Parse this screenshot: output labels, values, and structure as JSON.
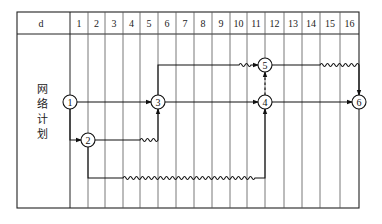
{
  "table": {
    "corner_label": "d",
    "columns": [
      "1",
      "2",
      "3",
      "4",
      "5",
      "6",
      "7",
      "8",
      "9",
      "10",
      "11",
      "12",
      "13",
      "14",
      "15",
      "16"
    ],
    "side_label_chars": [
      "网",
      "络",
      "计",
      "划"
    ]
  },
  "network": {
    "nodes": [
      {
        "id": "1",
        "label": "1"
      },
      {
        "id": "2",
        "label": "2"
      },
      {
        "id": "3",
        "label": "3"
      },
      {
        "id": "4",
        "label": "4"
      },
      {
        "id": "5",
        "label": "5"
      },
      {
        "id": "6",
        "label": "6"
      }
    ],
    "arrows": [
      {
        "from": "1",
        "to": "3",
        "type": "solid"
      },
      {
        "from": "1",
        "to": "2",
        "type": "solid"
      },
      {
        "from": "2",
        "to": "3",
        "type": "solid-with-free-float-wave"
      },
      {
        "from": "2",
        "to": "4",
        "type": "solid-with-free-float-wave"
      },
      {
        "from": "3",
        "to": "4",
        "type": "solid"
      },
      {
        "from": "3",
        "to": "5",
        "type": "solid-with-free-float-wave"
      },
      {
        "from": "4",
        "to": "5",
        "type": "dashed-dummy"
      },
      {
        "from": "4",
        "to": "6",
        "type": "solid"
      },
      {
        "from": "5",
        "to": "6",
        "type": "solid-with-free-float-wave"
      }
    ]
  },
  "colors": {
    "line": "#1a1a1a",
    "grid": "#555555",
    "background": "#ffffff"
  }
}
